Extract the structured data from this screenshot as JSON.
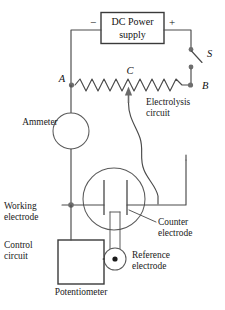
{
  "figure": {
    "components": {
      "power_supply": {
        "name": "dc-power-supply",
        "label_line1": "DC Power",
        "label_line2": "supply",
        "negative_terminal": "−",
        "positive_terminal": "+"
      },
      "switch": {
        "name": "switch",
        "label": "S"
      },
      "rheostat": {
        "name": "rheostat",
        "terminal_a": "A",
        "terminal_b": "B",
        "tap_c": "C"
      },
      "ammeter": {
        "name": "ammeter",
        "label": "Ammeter"
      },
      "potentiometer": {
        "name": "potentiometer",
        "label": "Potentiometer"
      }
    },
    "annotations": {
      "electrolysis_circuit_line1": "Electrolysis",
      "electrolysis_circuit_line2": "circuit",
      "working_electrode_line1": "Working",
      "working_electrode_line2": "electrode",
      "counter_electrode_line1": "Counter",
      "counter_electrode_line2": "electrode",
      "reference_electrode_line1": "Reference",
      "reference_electrode_line2": "electrode",
      "control_circuit_line1": "Control",
      "control_circuit_line2": "circuit"
    },
    "colors": {
      "background": "#ffffff",
      "wire": "#4a4a4a",
      "node": "#6e6e6e",
      "text": "#1a1a1a",
      "box_stroke": "#3a3a3a"
    }
  }
}
